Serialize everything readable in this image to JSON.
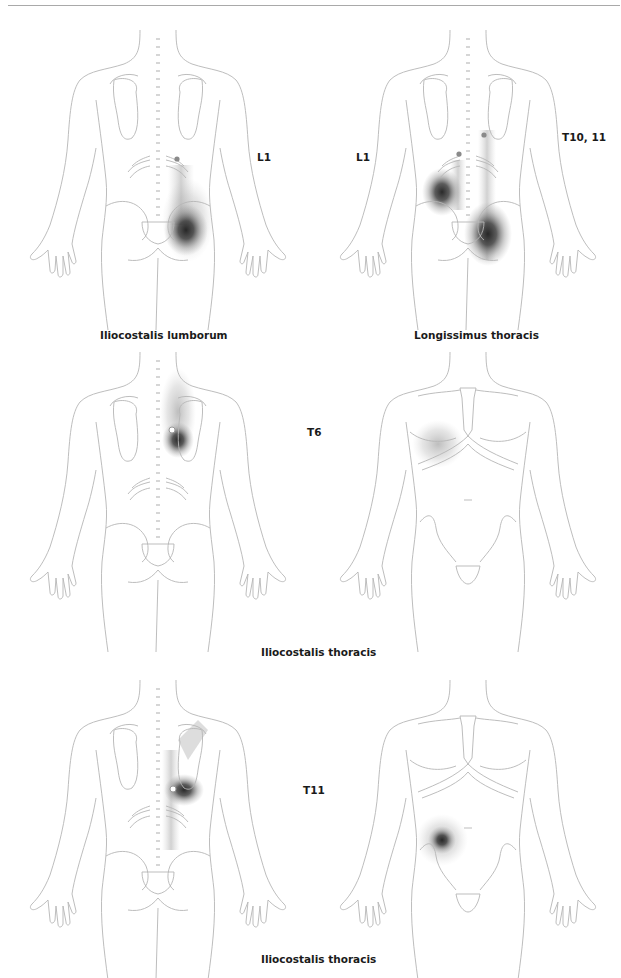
{
  "page": {
    "header_rule": true
  },
  "figures": [
    {
      "id": "iliocostalis-lumborum",
      "view": "posterior",
      "caption": "Iliocostalis lumborum",
      "labels": [
        {
          "text": "L1"
        }
      ]
    },
    {
      "id": "longissimus-thoracis",
      "view": "posterior",
      "caption": "Longissimus thoracis",
      "labels": [
        {
          "text": "L1"
        },
        {
          "text": "T10, 11"
        }
      ]
    },
    {
      "id": "iliocostalis-thoracis-t6",
      "views": [
        "posterior",
        "anterior"
      ],
      "caption": "Iliocostalis thoracis",
      "labels": [
        {
          "text": "T6"
        }
      ]
    },
    {
      "id": "iliocostalis-thoracis-t11",
      "views": [
        "posterior",
        "anterior"
      ],
      "caption": "Iliocostalis thoracis",
      "labels": [
        {
          "text": "T11"
        }
      ]
    }
  ],
  "colors": {
    "outline": "#b5b5b5",
    "pain_dark": "#2a2a2a",
    "trigger_point": "#888888",
    "text": "#1a1a1a"
  }
}
